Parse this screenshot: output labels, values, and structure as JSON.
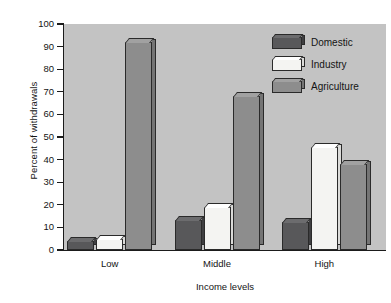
{
  "chart_data": {
    "type": "bar",
    "title": "",
    "xlabel": "Income levels",
    "ylabel": "Percent of withdrawals",
    "categories": [
      "Low",
      "Middle",
      "High"
    ],
    "series": [
      {
        "name": "Domestic",
        "color": "#58585a",
        "values": [
          4,
          13.5,
          12.5
        ]
      },
      {
        "name": "Industry",
        "color": "#f4f4f2",
        "values": [
          5,
          19,
          45.5
        ]
      },
      {
        "name": "Agriculture",
        "color": "#8d8d8d",
        "values": [
          92,
          68,
          38
        ]
      }
    ],
    "ylim": [
      0,
      100
    ],
    "yticks": [
      0,
      10,
      20,
      30,
      40,
      50,
      60,
      70,
      80,
      90,
      100
    ],
    "ytick_labels": [
      "0",
      "10",
      "20",
      "30",
      "40",
      "50",
      "60",
      "70",
      "80",
      "90",
      "100"
    ],
    "grid": false,
    "legend_position": "top-right",
    "plot_background": "#c3c3c3",
    "page_background": "#ffffff",
    "axis_color": "#1b1b1b",
    "bar_edge_color": "#2a2a2a"
  },
  "legend": {
    "entries": [
      {
        "label": "Domestic"
      },
      {
        "label": "Industry"
      },
      {
        "label": "Agriculture"
      }
    ]
  },
  "axes": {
    "y_title": "Percent of withdrawals",
    "x_title": "Income levels"
  }
}
